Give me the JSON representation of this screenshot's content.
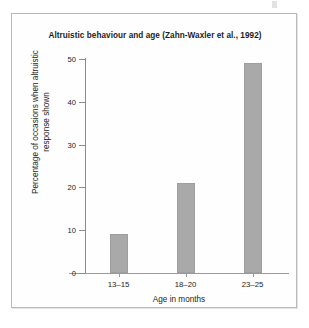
{
  "figure": {
    "title": "Altruistic behaviour and age (Zahn-Waxler et al., 1992)",
    "frame_color": "#b9b9b9",
    "background": "#ffffff"
  },
  "chart_data": {
    "type": "bar",
    "title": "Altruistic behaviour and age (Zahn-Waxler et al., 1992)",
    "categories": [
      "13–15",
      "18–20",
      "23–25"
    ],
    "values": [
      9,
      21,
      49
    ],
    "xlabel": "Age in months",
    "ylabel_line1": "Percentage of occasions when altruistic",
    "ylabel_line2": "response shown",
    "ylabel": "Percentage of occasions when altruistic response shown",
    "ylim": [
      0,
      50
    ],
    "yticks": [
      0,
      10,
      20,
      30,
      40,
      50
    ],
    "ytick_labels": [
      "0",
      "10",
      "20",
      "30",
      "40",
      "50"
    ],
    "grid": false,
    "legend": null,
    "bar_color": "#a9a9a9",
    "axis_color": "#8c8c8c"
  }
}
